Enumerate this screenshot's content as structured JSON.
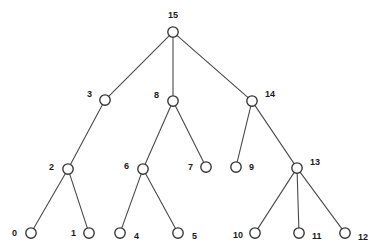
{
  "diagram": {
    "type": "tree-diagram",
    "width": 377,
    "height": 252,
    "background_color": "#ffffff",
    "node_fill_color": "#ffffff",
    "node_stroke_color": "#333333",
    "edge_color": "#4a4a4a",
    "label_color": "#1a1a1a",
    "node_radius": 5.2
  },
  "nodes": [
    {
      "id": "0",
      "label": "0",
      "x": 31,
      "y": 233,
      "label_x": 17,
      "label_y": 234,
      "label_anchor": "end"
    },
    {
      "id": "1",
      "label": "1",
      "x": 89,
      "y": 233,
      "label_x": 76,
      "label_y": 234,
      "label_anchor": "end"
    },
    {
      "id": "2",
      "label": "2",
      "x": 68,
      "y": 169,
      "label_x": 54,
      "label_y": 168,
      "label_anchor": "end"
    },
    {
      "id": "3",
      "label": "3",
      "x": 105,
      "y": 100,
      "label_x": 92,
      "label_y": 95,
      "label_anchor": "end"
    },
    {
      "id": "4",
      "label": "4",
      "x": 120,
      "y": 233,
      "label_x": 134,
      "label_y": 237,
      "label_anchor": "start"
    },
    {
      "id": "5",
      "label": "5",
      "x": 178,
      "y": 233,
      "label_x": 192,
      "label_y": 237,
      "label_anchor": "start"
    },
    {
      "id": "6",
      "label": "6",
      "x": 143,
      "y": 169,
      "label_x": 129,
      "label_y": 167,
      "label_anchor": "end"
    },
    {
      "id": "7",
      "label": "7",
      "x": 206,
      "y": 167,
      "label_x": 193,
      "label_y": 168,
      "label_anchor": "end"
    },
    {
      "id": "8",
      "label": "8",
      "x": 173,
      "y": 101,
      "label_x": 159,
      "label_y": 96,
      "label_anchor": "end"
    },
    {
      "id": "9",
      "label": "9",
      "x": 236,
      "y": 167,
      "label_x": 249,
      "label_y": 168,
      "label_anchor": "start"
    },
    {
      "id": "10",
      "label": "10",
      "x": 255,
      "y": 233,
      "label_x": 243,
      "label_y": 236,
      "label_anchor": "end"
    },
    {
      "id": "11",
      "label": "11",
      "x": 299,
      "y": 233,
      "label_x": 312,
      "label_y": 237,
      "label_anchor": "start"
    },
    {
      "id": "12",
      "label": "12",
      "x": 345,
      "y": 233,
      "label_x": 358,
      "label_y": 238,
      "label_anchor": "start"
    },
    {
      "id": "13",
      "label": "13",
      "x": 297,
      "y": 168,
      "label_x": 310,
      "label_y": 163,
      "label_anchor": "start"
    },
    {
      "id": "14",
      "label": "14",
      "x": 252,
      "y": 101,
      "label_x": 265,
      "label_y": 95,
      "label_anchor": "start"
    },
    {
      "id": "15",
      "label": "15",
      "x": 173,
      "y": 32,
      "label_x": 173,
      "label_y": 16,
      "label_anchor": "middle"
    }
  ],
  "edges": [
    {
      "from": "15",
      "to": "3"
    },
    {
      "from": "15",
      "to": "8"
    },
    {
      "from": "15",
      "to": "14"
    },
    {
      "from": "3",
      "to": "2"
    },
    {
      "from": "8",
      "to": "6"
    },
    {
      "from": "8",
      "to": "7"
    },
    {
      "from": "14",
      "to": "9"
    },
    {
      "from": "14",
      "to": "13"
    },
    {
      "from": "2",
      "to": "0"
    },
    {
      "from": "2",
      "to": "1"
    },
    {
      "from": "6",
      "to": "4"
    },
    {
      "from": "6",
      "to": "5"
    },
    {
      "from": "13",
      "to": "10"
    },
    {
      "from": "13",
      "to": "11"
    },
    {
      "from": "13",
      "to": "12"
    }
  ]
}
